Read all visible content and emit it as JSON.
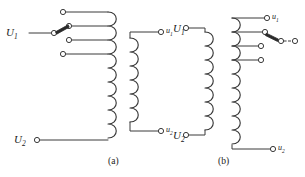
{
  "figure": {
    "background_color": "#ffffff",
    "line_color": "#3a3a3a",
    "text_color": "#1a1a1a",
    "terminal_fill": "#ffffff"
  },
  "diagram_a": {
    "caption": "(a)",
    "primary": {
      "top_label": "U",
      "top_label_sub": "1",
      "bottom_label": "U",
      "bottom_label_sub": "2"
    },
    "secondary": {
      "top_label": "u",
      "top_label_sub": "1",
      "bottom_label": "u",
      "bottom_label_sub": "2"
    },
    "tap_count": 4,
    "tap_selected_index": 2,
    "tap_side": "primary-high-voltage"
  },
  "diagram_b": {
    "caption": "(b)",
    "primary": {
      "top_label": "U",
      "top_label_sub": "1",
      "bottom_label": "U",
      "bottom_label_sub": "2"
    },
    "secondary": {
      "top_label": "u",
      "top_label_sub": "1",
      "bottom_label": "u",
      "bottom_label_sub": "2"
    },
    "tap_count": 4,
    "tap_selected_index": 2,
    "tap_side": "secondary-low-voltage"
  }
}
